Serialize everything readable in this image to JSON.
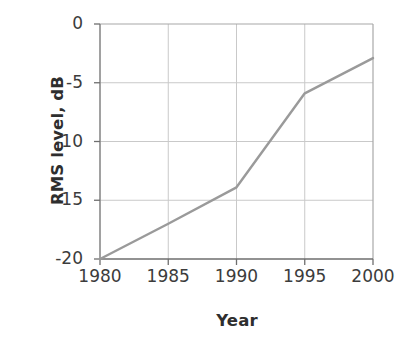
{
  "chart_data": {
    "type": "line",
    "title": "",
    "xlabel": "Year",
    "ylabel": "RMS level, dB",
    "x": [
      1980,
      1985,
      1990,
      1995,
      2000
    ],
    "values": [
      -20,
      -17,
      -13.9,
      -5.9,
      -2.9
    ],
    "series": [
      {
        "name": "RMS level",
        "x": [
          1980,
          1985,
          1990,
          1995,
          2000
        ],
        "values": [
          -20,
          -17,
          -13.9,
          -5.9,
          -2.9
        ]
      }
    ],
    "xlim": [
      1980,
      2000
    ],
    "ylim": [
      -20,
      0
    ],
    "xticks": [
      1980,
      1985,
      1990,
      1995,
      2000
    ],
    "yticks": [
      0,
      -5,
      -10,
      -15,
      -20
    ],
    "xtick_labels": [
      "1980",
      "1985",
      "1990",
      "1995",
      "2000"
    ],
    "ytick_labels": [
      "0",
      "-5",
      "-10",
      "-15",
      "-20"
    ],
    "grid": true,
    "legend": "none",
    "line_color": "#9a9a9a",
    "grid_color": "#cfcfcf",
    "axis_color": "#808080",
    "text_color": "#3a3a3a",
    "background": "#ffffff"
  }
}
